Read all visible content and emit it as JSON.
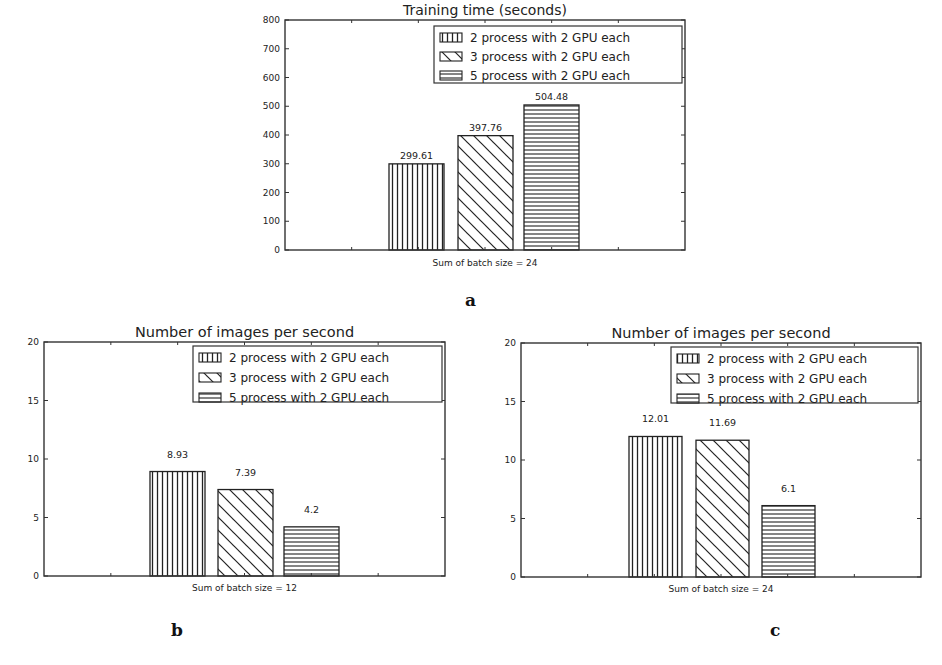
{
  "figure": {
    "panel_labels": {
      "a": "a",
      "b": "b",
      "c": "c"
    }
  },
  "legend_entries": [
    {
      "label": "2 process with 2 GPU each",
      "hatch": "vertical"
    },
    {
      "label": "3 process with 2 GPU each",
      "hatch": "diagonal"
    },
    {
      "label": "5 process with 2 GPU each",
      "hatch": "horizontal"
    }
  ],
  "chart_data": [
    {
      "id": "a",
      "type": "bar",
      "title": "Training time (seconds)",
      "xlabel": "Sum of batch size = 24",
      "ylabel": "",
      "ylim": [
        0,
        800
      ],
      "yticks": [
        0,
        100,
        200,
        300,
        400,
        500,
        600,
        700,
        800
      ],
      "categories": [
        "Sum of batch size = 24"
      ],
      "series": [
        {
          "name": "2 process with 2 GPU each",
          "values": [
            299.61
          ],
          "label": "299.61"
        },
        {
          "name": "3 process with 2 GPU each",
          "values": [
            397.76
          ],
          "label": "397.76"
        },
        {
          "name": "5 process with 2 GPU each",
          "values": [
            504.48
          ],
          "label": "504.48"
        }
      ],
      "grid": false,
      "legend_position": "upper right"
    },
    {
      "id": "b",
      "type": "bar",
      "title": "Number of images per second",
      "xlabel": "Sum of batch size = 12",
      "ylabel": "",
      "ylim": [
        0,
        20
      ],
      "yticks": [
        0,
        5,
        10,
        15,
        20
      ],
      "categories": [
        "Sum of batch size = 12"
      ],
      "series": [
        {
          "name": "2 process with 2 GPU each",
          "values": [
            8.93
          ],
          "label": "8.93"
        },
        {
          "name": "3 process with 2 GPU each",
          "values": [
            7.39
          ],
          "label": "7.39"
        },
        {
          "name": "5 process with 2 GPU each",
          "values": [
            4.2
          ],
          "label": "4.2"
        }
      ],
      "grid": false,
      "legend_position": "upper right"
    },
    {
      "id": "c",
      "type": "bar",
      "title": "Number of images per second",
      "xlabel": "Sum of batch size = 24",
      "ylabel": "",
      "ylim": [
        0,
        20
      ],
      "yticks": [
        0,
        5,
        10,
        15,
        20
      ],
      "categories": [
        "Sum of batch size = 24"
      ],
      "series": [
        {
          "name": "2 process with 2 GPU each",
          "values": [
            12.01
          ],
          "label": "12.01"
        },
        {
          "name": "3 process with 2 GPU each",
          "values": [
            11.69
          ],
          "label": "11.69"
        },
        {
          "name": "5 process with 2 GPU each",
          "values": [
            6.1
          ],
          "label": "6.1"
        }
      ],
      "grid": false,
      "legend_position": "upper right"
    }
  ]
}
